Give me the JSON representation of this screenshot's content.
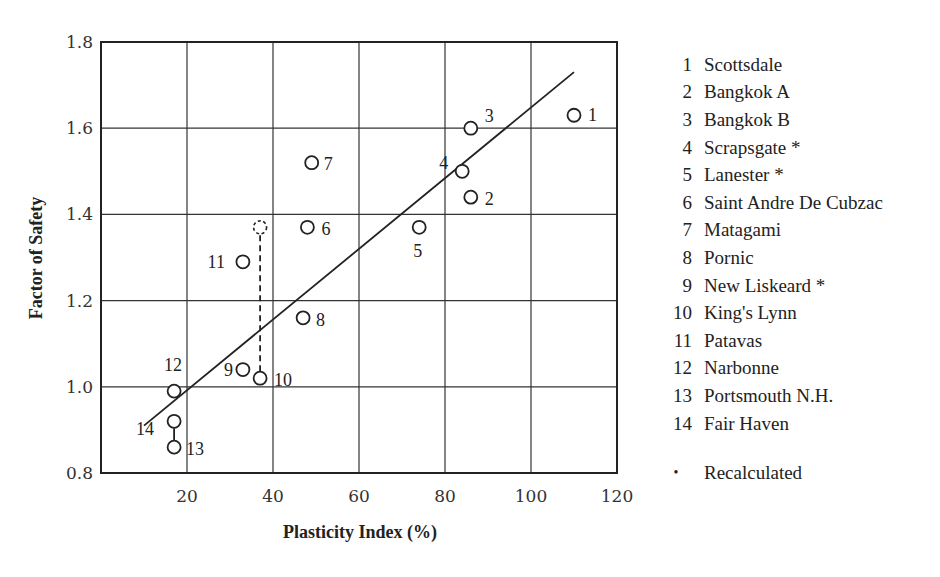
{
  "chart_data": {
    "type": "scatter",
    "title": "",
    "xlabel": "Plasticity Index (%)",
    "ylabel": "Factor of Safety",
    "xlim": [
      0,
      120
    ],
    "ylim": [
      0.8,
      1.8
    ],
    "xticks": [
      20,
      40,
      60,
      80,
      100,
      120
    ],
    "yticks": [
      0.8,
      1.0,
      1.2,
      1.4,
      1.6,
      1.8
    ],
    "xtick_labels": [
      "20",
      "40",
      "60",
      "80",
      "100",
      "120"
    ],
    "ytick_labels": [
      "0.8",
      "1.0",
      "1.2",
      "1.4",
      "1.6",
      "1.8"
    ],
    "grid": true,
    "legend_position": "right",
    "points": [
      {
        "id": 1,
        "label": "1",
        "name": "Scottsdale",
        "x": 110,
        "y": 1.63
      },
      {
        "id": 2,
        "label": "2",
        "name": "Bangkok A",
        "x": 86,
        "y": 1.44
      },
      {
        "id": 3,
        "label": "3",
        "name": "Bangkok B",
        "x": 86,
        "y": 1.6
      },
      {
        "id": 4,
        "label": "4",
        "name": "Scrapsgate *",
        "x": 84,
        "y": 1.5
      },
      {
        "id": 5,
        "label": "5",
        "name": "Lanester *",
        "x": 74,
        "y": 1.37
      },
      {
        "id": 6,
        "label": "6",
        "name": "Saint Andre De Cubzac",
        "x": 48,
        "y": 1.37
      },
      {
        "id": 7,
        "label": "7",
        "name": "Matagami",
        "x": 49,
        "y": 1.52
      },
      {
        "id": 8,
        "label": "8",
        "name": "Pornic",
        "x": 47,
        "y": 1.16
      },
      {
        "id": 9,
        "label": "9",
        "name": "New Liskeard *",
        "x": 33,
        "y": 1.04
      },
      {
        "id": 10,
        "label": "10",
        "name": "King's Lynn",
        "x": 37,
        "y": 1.02
      },
      {
        "id": 11,
        "label": "11",
        "name": "Patavas",
        "x": 33,
        "y": 1.29
      },
      {
        "id": 12,
        "label": "12",
        "name": "Narbonne",
        "x": 17,
        "y": 0.99
      },
      {
        "id": 13,
        "label": "13",
        "name": "Portsmouth N.H.",
        "x": 17,
        "y": 0.86
      },
      {
        "id": 14,
        "label": "14",
        "name": "Fair Haven",
        "x": 17,
        "y": 0.92
      }
    ],
    "recalculated_point": {
      "for_id": 10,
      "x": 37,
      "y": 1.37,
      "style": "dashed"
    },
    "connectors": [
      {
        "from": [
          37,
          1.02
        ],
        "to": [
          37,
          1.37
        ],
        "style": "dashed"
      },
      {
        "from": [
          17,
          0.92
        ],
        "to": [
          17,
          0.86
        ],
        "style": "solid"
      }
    ],
    "trend_line": {
      "x": [
        10,
        110
      ],
      "y": [
        0.91,
        1.73
      ]
    },
    "annotations": [
      "* Recalculated"
    ]
  },
  "legend": {
    "items": [
      {
        "num": "1",
        "name": "Scottsdale"
      },
      {
        "num": "2",
        "name": "Bangkok A"
      },
      {
        "num": "3",
        "name": "Bangkok B"
      },
      {
        "num": "4",
        "name": "Scrapsgate *"
      },
      {
        "num": "5",
        "name": "Lanester *"
      },
      {
        "num": "6",
        "name": "Saint Andre De Cubzac"
      },
      {
        "num": "7",
        "name": "Matagami"
      },
      {
        "num": "8",
        "name": "Pornic"
      },
      {
        "num": "9",
        "name": "New Liskeard *"
      },
      {
        "num": "10",
        "name": "King's Lynn"
      },
      {
        "num": "11",
        "name": "Patavas"
      },
      {
        "num": "12",
        "name": "Narbonne"
      },
      {
        "num": "13",
        "name": "Portsmouth N.H."
      },
      {
        "num": "14",
        "name": "Fair Haven"
      }
    ],
    "note_bullet": "•",
    "note": "Recalculated"
  }
}
